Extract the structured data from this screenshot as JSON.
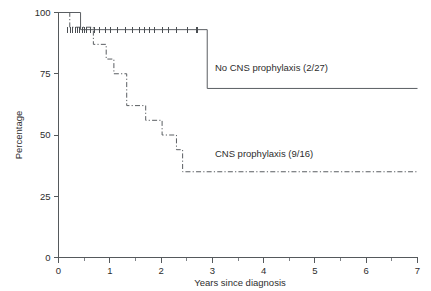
{
  "chart_data": {
    "type": "line",
    "title": "",
    "subtitle": "",
    "xlabel": "Years since diagnosis",
    "ylabel": "Percentage",
    "xlim": [
      0,
      7
    ],
    "ylim": [
      0,
      100
    ],
    "xticks": [
      0,
      1,
      2,
      3,
      4,
      5,
      6,
      7
    ],
    "xtick_labels": [
      "0",
      "1",
      "2",
      "3",
      "4",
      "5",
      "6",
      "7"
    ],
    "xticks_minor": [
      0.5,
      1.5,
      2.5,
      3.5,
      4.5,
      5.5,
      6.5
    ],
    "yticks": [
      0,
      25,
      50,
      75,
      100
    ],
    "ytick_labels": [
      "0",
      "25",
      "50",
      "75",
      "100"
    ],
    "grid": false,
    "legend_position": "inline-annotations",
    "series": [
      {
        "name": "No CNS prophylaxis (2/27)",
        "label": "No CNS prophylaxis (2/27)",
        "style": "solid",
        "events": "2/27",
        "n_events": 2,
        "n_total": 27,
        "label_x": 3.05,
        "label_y": 76,
        "steps": [
          {
            "x": 0.0,
            "y": 100
          },
          {
            "x": 0.43,
            "y": 100
          },
          {
            "x": 0.43,
            "y": 93
          },
          {
            "x": 2.9,
            "y": 93
          },
          {
            "x": 2.9,
            "y": 69
          },
          {
            "x": 7.0,
            "y": 69
          }
        ],
        "censor_times": [
          0.18,
          0.24,
          0.28,
          0.33,
          0.37,
          0.41,
          0.46,
          0.5,
          0.55,
          0.62,
          0.7,
          0.8,
          0.92,
          1.02,
          1.15,
          1.3,
          1.44,
          1.58,
          1.68,
          1.78,
          1.88,
          2.02,
          2.14,
          2.3,
          2.52,
          2.7
        ],
        "censor_percent": 93
      },
      {
        "name": "CNS prophylaxis (9/16)",
        "label": "CNS prophylaxis (9/16)",
        "style": "dash-dot",
        "events": "9/16",
        "n_events": 9,
        "n_total": 16,
        "label_x": 3.05,
        "label_y": 41,
        "steps": [
          {
            "x": 0.0,
            "y": 100
          },
          {
            "x": 0.22,
            "y": 100
          },
          {
            "x": 0.22,
            "y": 94
          },
          {
            "x": 0.68,
            "y": 94
          },
          {
            "x": 0.68,
            "y": 87
          },
          {
            "x": 0.93,
            "y": 87
          },
          {
            "x": 0.93,
            "y": 81
          },
          {
            "x": 1.08,
            "y": 81
          },
          {
            "x": 1.08,
            "y": 75
          },
          {
            "x": 1.33,
            "y": 75
          },
          {
            "x": 1.33,
            "y": 62
          },
          {
            "x": 1.7,
            "y": 62
          },
          {
            "x": 1.7,
            "y": 56
          },
          {
            "x": 2.02,
            "y": 56
          },
          {
            "x": 2.02,
            "y": 50
          },
          {
            "x": 2.3,
            "y": 50
          },
          {
            "x": 2.3,
            "y": 44
          },
          {
            "x": 2.42,
            "y": 44
          },
          {
            "x": 2.42,
            "y": 35
          },
          {
            "x": 7.0,
            "y": 35
          }
        ],
        "censor_times": [],
        "censor_percent": null
      }
    ]
  },
  "axes": {
    "y_title": "Percentage",
    "x_title": "Years since diagnosis"
  },
  "colors": {
    "background": "#ffffff",
    "axis": "#55595c",
    "curve": "#5a5e62",
    "text": "#2d2d2d"
  }
}
